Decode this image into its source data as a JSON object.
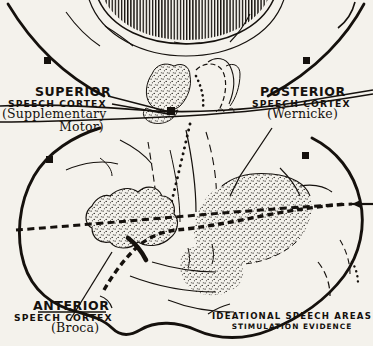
{
  "figure": {
    "background_color": "#f4f2ec",
    "ink_color": "#15110d"
  },
  "labels": {
    "superior": {
      "line1": "SUPERIOR",
      "line2": "SPEECH CORTEX",
      "line3": "(Supplementary",
      "line4": "Motor)"
    },
    "posterior": {
      "line1": "POSTERIOR",
      "line2": "SPEECH CORTEX",
      "line3": "(Wernicke)"
    },
    "anterior": {
      "line1": "ANTERIOR",
      "line2": "SPEECH CORTEX",
      "line3": "(Broca)"
    }
  },
  "caption": {
    "line1": "IDEATIONAL SPEECH AREAS",
    "line2": "STIMULATION EVIDENCE"
  },
  "regions": [
    {
      "name": "supplementary-motor-area",
      "fill": "stipple",
      "view": "medial"
    },
    {
      "name": "wernicke-area",
      "fill": "stipple",
      "view": "lateral"
    },
    {
      "name": "broca-area",
      "fill": "stipple",
      "view": "lateral"
    }
  ],
  "markers": {
    "shape": "square",
    "color": "#15110d",
    "count": 5
  },
  "annotations": {
    "arrow_direction": "left",
    "central_sulcus_style": "dotted",
    "sylvian_fissure_style": "heavy-dashed",
    "corpus_callosum_style": "vertical-hatching"
  }
}
